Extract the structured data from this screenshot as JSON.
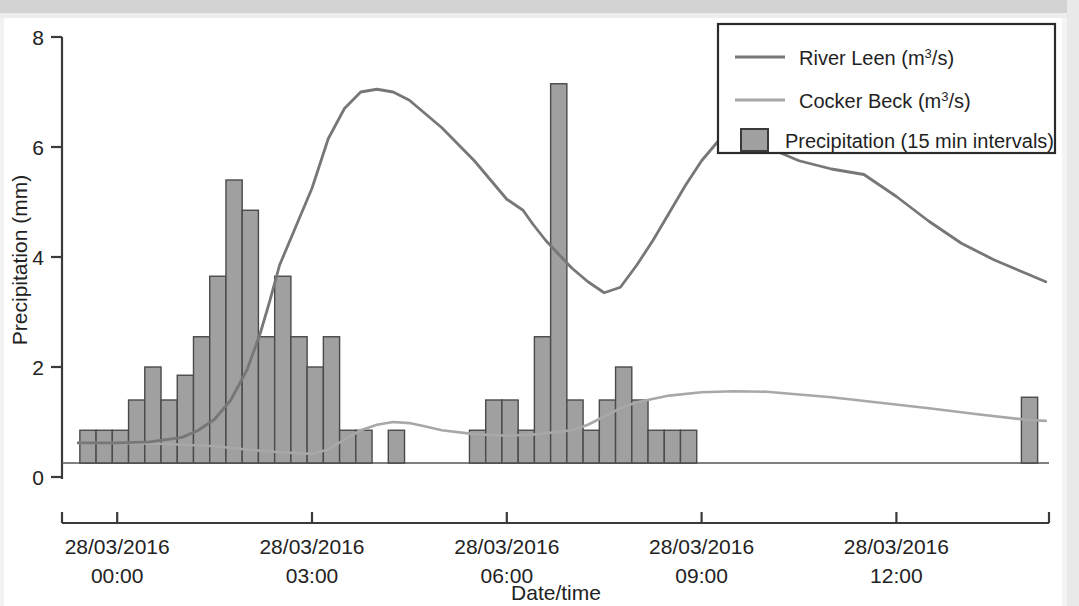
{
  "chart_data": {
    "type": "line",
    "title": "",
    "xlabel": "Date/time",
    "ylabel": "Precipitation (mm)",
    "ylim": [
      0,
      8
    ],
    "yticks": [
      0,
      2,
      4,
      6,
      8
    ],
    "ytick_labels": [
      "0",
      "2",
      "4",
      "6",
      "8"
    ],
    "xlim": [
      "28/03/2016 23:30",
      "28/03/2016 14:15"
    ],
    "xtick_labels": [
      {
        "date": "28/03/2016",
        "time": "00:00"
      },
      {
        "date": "28/03/2016",
        "time": "03:00"
      },
      {
        "date": "28/03/2016",
        "time": "06:00"
      },
      {
        "date": "28/03/2016",
        "time": "09:00"
      },
      {
        "date": "28/03/2016",
        "time": "12:00"
      }
    ],
    "grid": false,
    "legend_position": "top-right",
    "series": [
      {
        "name": "River Leen (m³/s)",
        "kind": "line",
        "color": "#777777",
        "x_hours": [
          -0.6,
          0.0,
          0.5,
          1.0,
          1.25,
          1.5,
          1.75,
          2.0,
          2.2,
          2.35,
          2.5,
          2.75,
          3.0,
          3.25,
          3.5,
          3.75,
          4.0,
          4.25,
          4.5,
          4.75,
          5.0,
          5.25,
          5.5,
          5.75,
          6.0,
          6.25,
          6.4,
          6.6,
          6.8,
          7.0,
          7.25,
          7.5,
          7.75,
          8.0,
          8.25,
          8.5,
          8.75,
          9.0,
          9.25,
          9.5,
          10.0,
          10.5,
          11.0,
          11.5,
          12.0,
          12.5,
          13.0,
          13.5,
          14.0,
          14.3
        ],
        "values": [
          0.62,
          0.62,
          0.64,
          0.72,
          0.85,
          1.05,
          1.4,
          1.95,
          2.6,
          3.2,
          3.85,
          4.55,
          5.25,
          6.15,
          6.7,
          7.0,
          7.05,
          7.0,
          6.85,
          6.6,
          6.35,
          6.05,
          5.75,
          5.4,
          5.05,
          4.85,
          4.6,
          4.3,
          4.05,
          3.8,
          3.55,
          3.35,
          3.45,
          3.85,
          4.3,
          4.8,
          5.3,
          5.75,
          6.1,
          6.28,
          6.0,
          5.75,
          5.6,
          5.5,
          5.1,
          4.65,
          4.25,
          3.95,
          3.7,
          3.55
        ]
      },
      {
        "name": "Cocker Beck (m³/s)",
        "kind": "line",
        "color": "#a8a8a8",
        "x_hours": [
          -0.6,
          0.0,
          0.75,
          1.5,
          2.0,
          2.5,
          3.0,
          3.25,
          3.5,
          3.75,
          4.0,
          4.25,
          4.5,
          4.75,
          5.0,
          5.5,
          6.0,
          6.5,
          7.0,
          7.25,
          7.5,
          7.75,
          8.0,
          8.5,
          9.0,
          9.5,
          10.0,
          10.5,
          11.0,
          11.75,
          12.5,
          13.25,
          14.0,
          14.3
        ],
        "values": [
          0.62,
          0.62,
          0.6,
          0.56,
          0.5,
          0.45,
          0.42,
          0.5,
          0.68,
          0.85,
          0.95,
          1.0,
          0.98,
          0.92,
          0.85,
          0.78,
          0.75,
          0.78,
          0.85,
          0.95,
          1.1,
          1.25,
          1.36,
          1.48,
          1.54,
          1.56,
          1.55,
          1.5,
          1.45,
          1.35,
          1.25,
          1.14,
          1.04,
          1.02
        ]
      },
      {
        "name": "Precipitation (15 min intervals)",
        "kind": "bar",
        "color": "#a0a0a0",
        "bar_width_minutes": 15,
        "baseline": 0.25,
        "x_hours": [
          -0.45,
          -0.2,
          0.05,
          0.3,
          0.55,
          0.8,
          1.05,
          1.3,
          1.55,
          1.8,
          2.05,
          2.3,
          2.55,
          2.8,
          3.05,
          3.3,
          3.55,
          3.8,
          4.3,
          5.55,
          5.8,
          6.05,
          6.3,
          6.55,
          6.8,
          7.05,
          7.3,
          7.55,
          7.8,
          8.05,
          8.3,
          8.55,
          8.8,
          14.05
        ],
        "values": [
          0.85,
          0.85,
          0.85,
          1.4,
          2.0,
          1.4,
          1.85,
          2.55,
          3.65,
          5.4,
          4.85,
          2.55,
          3.65,
          2.55,
          2.0,
          2.55,
          0.85,
          0.85,
          0.85,
          0.85,
          1.4,
          1.4,
          0.85,
          2.55,
          7.15,
          1.4,
          0.85,
          1.4,
          2.0,
          1.4,
          0.85,
          0.85,
          0.85,
          1.45
        ]
      }
    ]
  },
  "legend": {
    "items": [
      {
        "label_main": "River Leen (m",
        "label_sup": "3",
        "label_tail": "/s)",
        "marker": "line",
        "color": "#777777"
      },
      {
        "label_main": "Cocker Beck (m",
        "label_sup": "3",
        "label_tail": "/s)",
        "marker": "line",
        "color": "#a8a8a8"
      },
      {
        "label_main": "Precipitation (15 min intervals)",
        "label_sup": "",
        "label_tail": "",
        "marker": "swatch",
        "color": "#a0a0a0"
      }
    ]
  },
  "axes": {
    "y_title": "Precipitation (mm)",
    "x_title": "Date/time",
    "y_tick_0": "0",
    "y_tick_1": "2",
    "y_tick_2": "4",
    "y_tick_3": "6",
    "y_tick_4": "8",
    "x_tick_0_date": "28/03/2016",
    "x_tick_0_time": "00:00",
    "x_tick_1_date": "28/03/2016",
    "x_tick_1_time": "03:00",
    "x_tick_2_date": "28/03/2016",
    "x_tick_2_time": "06:00",
    "x_tick_3_date": "28/03/2016",
    "x_tick_3_time": "09:00",
    "x_tick_4_date": "28/03/2016",
    "x_tick_4_time": "12:00"
  },
  "colors": {
    "river_leen": "#777777",
    "cocker_beck": "#a8a8a8",
    "precipitation": "#a0a0a0",
    "axis": "#3a3a3a",
    "page_edge": "#d2d2d2"
  }
}
